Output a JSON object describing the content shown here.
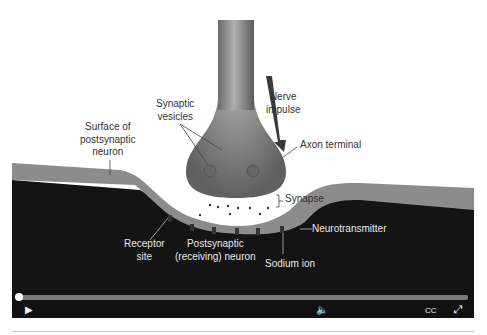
{
  "labels": {
    "nerve_impulse": [
      "Nerve",
      "impulse"
    ],
    "synaptic_vesicles": [
      "Synaptic",
      "vesicles"
    ],
    "surface": [
      "Surface of",
      "postsynaptic",
      "neuron"
    ],
    "axon_terminal": "Axon terminal",
    "synapse": "Synapse",
    "neurotransmitter": "Neurotransmitter",
    "receptor_site": [
      "Receptor",
      "site"
    ],
    "postsynaptic": [
      "Postsynaptic",
      "(receiving) neuron"
    ],
    "sodium_ion": "Sodium ion"
  },
  "player": {
    "progress": 0,
    "cc_label": "CC"
  }
}
